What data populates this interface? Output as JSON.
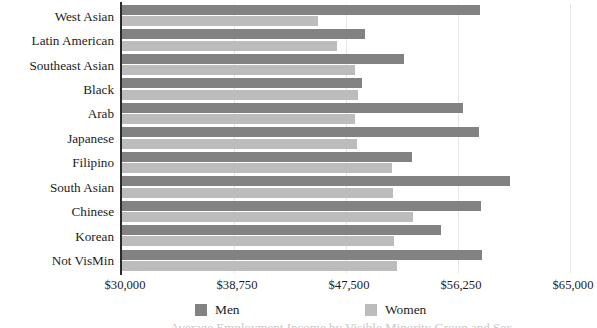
{
  "chart_data": {
    "type": "bar",
    "orientation": "horizontal",
    "title": "",
    "xlabel": "",
    "ylabel": "",
    "grid": true,
    "legend_position": "bottom",
    "xlim": [
      30000,
      65000
    ],
    "xticks": [
      30000,
      38750,
      47500,
      56250,
      65000
    ],
    "xtick_labels": [
      "$30,000",
      "$38,750",
      "$47,500",
      "$56,250",
      "$65,000"
    ],
    "categories": [
      "West Asian",
      "Latin American",
      "Southeast Asian",
      "Black",
      "Arab",
      "Japanese",
      "Filipino",
      "South Asian",
      "Chinese",
      "Korean",
      "Not VisMin"
    ],
    "series": [
      {
        "name": "Men",
        "color": "#828282",
        "values": [
          57950,
          49000,
          52000,
          48750,
          56650,
          57900,
          52650,
          60300,
          58050,
          54900,
          58100
        ]
      },
      {
        "name": "Women",
        "color": "#bcbcbc",
        "values": [
          45300,
          46800,
          48200,
          48450,
          48200,
          48350,
          51100,
          51200,
          52700,
          51250,
          51500
        ]
      }
    ]
  },
  "legend": {
    "men_label": "Men",
    "women_label": "Women"
  },
  "caption_sliver": "Average Employment Income by Visible Minority Group and Sex"
}
